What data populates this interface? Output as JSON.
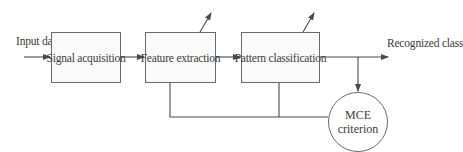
{
  "diagram": {
    "type": "block-diagram",
    "input_label": "Input data",
    "output_label": "Recognized class",
    "blocks": [
      {
        "id": "signal_acquisition",
        "label": "Signal acquisition"
      },
      {
        "id": "feature_extraction",
        "label": "Feature extraction"
      },
      {
        "id": "pattern_classification",
        "label": "Pattern classification"
      }
    ],
    "criterion": {
      "line1": "MCE",
      "line2": "criterion"
    },
    "edges": [
      {
        "from": "input",
        "to": "signal_acquisition"
      },
      {
        "from": "signal_acquisition",
        "to": "feature_extraction"
      },
      {
        "from": "feature_extraction",
        "to": "pattern_classification"
      },
      {
        "from": "pattern_classification",
        "to": "output"
      },
      {
        "from": "output",
        "to": "criterion"
      },
      {
        "from": "criterion",
        "to": "feature_extraction",
        "style": "feedback"
      },
      {
        "from": "criterion",
        "to": "pattern_classification",
        "style": "feedback"
      }
    ],
    "adjustable_blocks": [
      "feature_extraction",
      "pattern_classification"
    ],
    "colors": {
      "line": "#4a4a4a",
      "box_border": "#6a6a6a",
      "box_fill": "#fafafa",
      "text": "#3a3a3a"
    }
  }
}
